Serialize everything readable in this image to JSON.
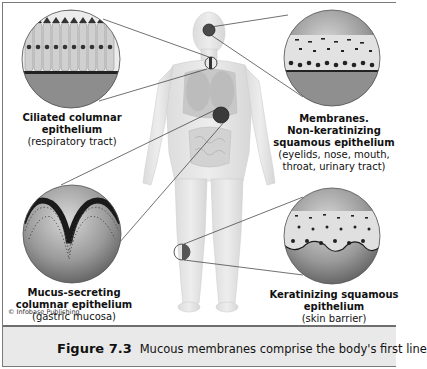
{
  "figure": {
    "number_label": "Figure 7.3",
    "caption_text": "Mucous membranes comprise the body's first line",
    "copyright": "© Infobase Publishing",
    "colors": {
      "frame_border": "#7a7a7a",
      "caption_background": "#e9e9e9",
      "body_fill": "#e4e4e4",
      "magnifier_dark": "#5a5a5a"
    }
  },
  "callouts": [
    {
      "id": "ciliated",
      "title_lines": [
        "Ciliated columnar",
        "epithelium"
      ],
      "title_line_1": "Ciliated columnar",
      "title_line_2": "epithelium",
      "detail_line_1": "(respiratory tract)",
      "body_location": "trachea",
      "icon": "ciliated-epithelium-magnifier"
    },
    {
      "id": "non-keratinizing",
      "title_line_1": "Membranes.",
      "title_line_2": "Non-keratinizing",
      "title_line_3": "squamous epithelium",
      "detail_line_1": "(eyelids, nose, mouth,",
      "detail_line_2": "throat, urinary tract)",
      "body_location": "eye",
      "icon": "squamous-epithelium-magnifier"
    },
    {
      "id": "mucus-secreting",
      "title_line_1": "Mucus-secreting",
      "title_line_2": "columnar epithelium",
      "detail_line_1": "(gastric mucosa)",
      "body_location": "stomach",
      "icon": "gastric-mucosa-magnifier"
    },
    {
      "id": "keratinizing",
      "title_line_1": "Keratinizing squamous",
      "title_line_2": "epithelium",
      "detail_line_1": "(skin barrier)",
      "body_location": "knee / leg skin",
      "icon": "keratinized-skin-magnifier"
    }
  ]
}
